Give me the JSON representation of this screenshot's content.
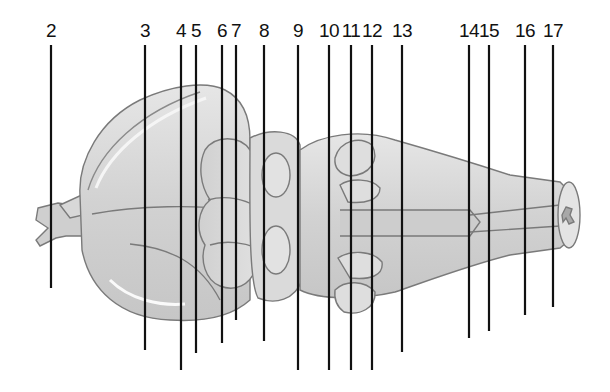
{
  "diagram": {
    "colors": {
      "line": "#111111",
      "tissue_fill": "#d9d9d9",
      "tissue_light": "#ececec",
      "tissue_outline": "#7a7a7a",
      "background": "#ffffff"
    },
    "labels": [
      {
        "text": "2",
        "x": 51,
        "y_end": 288
      },
      {
        "text": "3",
        "x": 145,
        "y_end": 350
      },
      {
        "text": "4",
        "x": 181,
        "y_end": 370
      },
      {
        "text": "5",
        "x": 196,
        "y_end": 353
      },
      {
        "text": "6",
        "x": 222,
        "y_end": 343
      },
      {
        "text": "7",
        "x": 236,
        "y_end": 320
      },
      {
        "text": "8",
        "x": 264,
        "y_end": 341
      },
      {
        "text": "9",
        "x": 298,
        "y_end": 370
      },
      {
        "text": "10",
        "x": 329,
        "y_end": 370
      },
      {
        "text": "11",
        "x": 351,
        "y_end": 370
      },
      {
        "text": "12",
        "x": 372,
        "y_end": 370
      },
      {
        "text": "13",
        "x": 402,
        "y_end": 352
      },
      {
        "text": "14",
        "x": 469,
        "y_end": 338
      },
      {
        "text": "15",
        "x": 489,
        "y_end": 331
      },
      {
        "text": "16",
        "x": 525,
        "y_end": 315
      },
      {
        "text": "17",
        "x": 553,
        "y_end": 307
      }
    ]
  }
}
